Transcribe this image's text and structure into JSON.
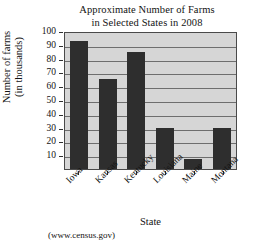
{
  "chart_data": {
    "type": "bar",
    "title": "Approximate Number of Farms in Selected States in 2008",
    "title_lines": [
      "Approximate Number of Farms",
      "in Selected States in 2008"
    ],
    "xlabel": "State",
    "ylabel": "Number of farms (in thousands)",
    "ylabel_lines": [
      "Number of farms",
      "(in thousands)"
    ],
    "categories": [
      "Iowa",
      "Kansas",
      "Kentucky",
      "Louisiana",
      "Maine",
      "Montana"
    ],
    "values": [
      93,
      65,
      85,
      30,
      7,
      30
    ],
    "ylim": [
      0,
      100
    ],
    "yticks": [
      100,
      90,
      80,
      70,
      60,
      50,
      40,
      30,
      20,
      10
    ],
    "ytick_labels": [
      "100",
      "90",
      "80",
      "70",
      "60",
      "50",
      "40",
      "30",
      "20",
      "10"
    ],
    "grid": true,
    "legend": null,
    "source": "(www.census.gov)",
    "bar_color": "#2e2e2e",
    "plot_background": "#d6d6d6",
    "axis_color": "#4a4a4a"
  }
}
